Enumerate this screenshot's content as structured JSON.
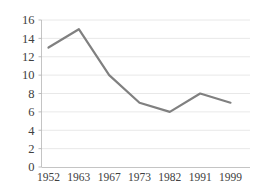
{
  "chart_data": {
    "type": "line",
    "title": "",
    "subtitle": "",
    "xlabel": "",
    "ylabel": "",
    "categories": [
      "1952",
      "1963",
      "1967",
      "1973",
      "1982",
      "1991",
      "1999"
    ],
    "values": [
      13,
      15,
      10,
      7,
      6,
      8,
      7
    ],
    "series": [
      {
        "name": "",
        "values": [
          13,
          15,
          10,
          7,
          6,
          8,
          7
        ],
        "color": "#808080"
      }
    ],
    "ylim": [
      0,
      16
    ],
    "ytick_step": 2,
    "ytick_labels": [
      "0",
      "2",
      "4",
      "6",
      "8",
      "10",
      "12",
      "14",
      "16"
    ],
    "xtick_labels": [
      "1952",
      "1963",
      "1967",
      "1973",
      "1982",
      "1991",
      "1999"
    ],
    "grid": "horizontal",
    "grid_color": "#e2e2e2",
    "legend": "none",
    "legend_position": "",
    "annotations": [],
    "background_color": "#ffffff",
    "axis_color": "#bdbdbd"
  }
}
